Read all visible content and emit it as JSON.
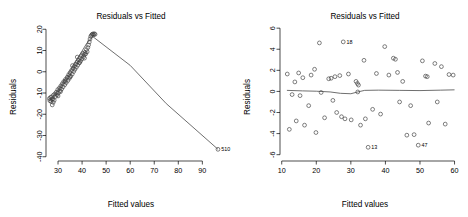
{
  "figure": {
    "panel_count": 2,
    "background_color": "#ffffff",
    "point_color": "#3a3a3a",
    "line_color": "#4a4a4a"
  },
  "chart_data": [
    {
      "type": "scatter",
      "panel": "left",
      "title": "Residuals vs Fitted",
      "xlabel": "Fitted values",
      "ylabel": "Residuals",
      "xlim": [
        25,
        99
      ],
      "ylim": [
        -42,
        22
      ],
      "xticks": [
        30,
        40,
        50,
        60,
        70,
        80,
        90
      ],
      "xtick_labels": [
        "30",
        "40",
        "50",
        "60",
        "70",
        "80",
        "90"
      ],
      "yticks": [
        20,
        10,
        0,
        -10,
        -20,
        -30,
        -40
      ],
      "ytick_labels": [
        "20",
        "10",
        "0",
        "-10",
        "-20",
        "-30",
        "-40"
      ],
      "grid": false,
      "legend": false,
      "annotations": [
        {
          "label": "510",
          "x": 96.5,
          "y": -36.5
        }
      ],
      "smooth_line": {
        "name": "loess-smoother",
        "x": [
          27.0,
          33.0,
          38.0,
          42.0,
          44.5,
          60.0,
          75.0,
          96.5
        ],
        "y": [
          -13.0,
          -3.5,
          6.0,
          13.5,
          16.5,
          3.0,
          -15.0,
          -36.5
        ]
      },
      "points": [
        {
          "x": 26.4,
          "y": -12.6
        },
        {
          "x": 26.6,
          "y": -13.6
        },
        {
          "x": 26.9,
          "y": -12.1
        },
        {
          "x": 27.1,
          "y": -14.0
        },
        {
          "x": 27.3,
          "y": -11.8
        },
        {
          "x": 27.4,
          "y": -13.0
        },
        {
          "x": 27.6,
          "y": -15.6
        },
        {
          "x": 27.8,
          "y": -12.8
        },
        {
          "x": 28.1,
          "y": -11.0
        },
        {
          "x": 28.4,
          "y": -13.4
        },
        {
          "x": 28.7,
          "y": -10.4
        },
        {
          "x": 29.0,
          "y": -11.6
        },
        {
          "x": 29.3,
          "y": -9.6
        },
        {
          "x": 29.6,
          "y": -10.8
        },
        {
          "x": 29.9,
          "y": -8.4
        },
        {
          "x": 30.2,
          "y": -9.9
        },
        {
          "x": 30.6,
          "y": -7.6
        },
        {
          "x": 30.9,
          "y": -8.9
        },
        {
          "x": 31.2,
          "y": -6.6
        },
        {
          "x": 31.5,
          "y": -8.1
        },
        {
          "x": 31.8,
          "y": -5.6
        },
        {
          "x": 32.1,
          "y": -7.1
        },
        {
          "x": 32.4,
          "y": -4.6
        },
        {
          "x": 32.8,
          "y": -6.1
        },
        {
          "x": 33.1,
          "y": -3.6
        },
        {
          "x": 33.4,
          "y": -5.1
        },
        {
          "x": 33.8,
          "y": -2.6
        },
        {
          "x": 34.1,
          "y": -4.1
        },
        {
          "x": 34.4,
          "y": -1.4
        },
        {
          "x": 34.7,
          "y": -3.1
        },
        {
          "x": 35.0,
          "y": -0.4
        },
        {
          "x": 35.3,
          "y": -2.1
        },
        {
          "x": 35.6,
          "y": 0.6
        },
        {
          "x": 35.9,
          "y": -1.1
        },
        {
          "x": 36.2,
          "y": 1.6
        },
        {
          "x": 36.5,
          "y": 0.1
        },
        {
          "x": 36.8,
          "y": 2.6
        },
        {
          "x": 37.0,
          "y": 1.1
        },
        {
          "x": 37.3,
          "y": 3.6
        },
        {
          "x": 37.6,
          "y": 2.1
        },
        {
          "x": 37.9,
          "y": 4.6
        },
        {
          "x": 38.2,
          "y": 3.1
        },
        {
          "x": 38.5,
          "y": 5.6
        },
        {
          "x": 38.8,
          "y": 4.1
        },
        {
          "x": 39.1,
          "y": 6.6
        },
        {
          "x": 39.4,
          "y": 5.1
        },
        {
          "x": 39.7,
          "y": 7.6
        },
        {
          "x": 40.0,
          "y": 6.1
        },
        {
          "x": 40.3,
          "y": 8.6
        },
        {
          "x": 40.6,
          "y": 7.1
        },
        {
          "x": 40.9,
          "y": 8.1
        },
        {
          "x": 41.2,
          "y": 9.1
        },
        {
          "x": 41.5,
          "y": 8.4
        },
        {
          "x": 41.8,
          "y": 10.4
        },
        {
          "x": 42.1,
          "y": 9.4
        },
        {
          "x": 42.4,
          "y": 11.4
        },
        {
          "x": 42.7,
          "y": 12.6
        },
        {
          "x": 43.0,
          "y": 14.0
        },
        {
          "x": 43.3,
          "y": 15.4
        },
        {
          "x": 43.6,
          "y": 16.6
        },
        {
          "x": 43.9,
          "y": 17.2
        },
        {
          "x": 44.2,
          "y": 17.6
        },
        {
          "x": 44.5,
          "y": 17.8
        },
        {
          "x": 44.8,
          "y": 17.4
        },
        {
          "x": 45.1,
          "y": 17.9
        },
        {
          "x": 45.4,
          "y": 17.6
        },
        {
          "x": 33.0,
          "y": -4.4
        },
        {
          "x": 34.9,
          "y": -2.4
        },
        {
          "x": 36.0,
          "y": 2.9
        },
        {
          "x": 38.0,
          "y": 6.9
        },
        {
          "x": 39.0,
          "y": 4.4
        },
        {
          "x": 41.0,
          "y": 6.4
        },
        {
          "x": 28.0,
          "y": -14.4
        },
        {
          "x": 30.0,
          "y": -11.4
        },
        {
          "x": 31.0,
          "y": -9.4
        },
        {
          "x": 96.5,
          "y": -36.5
        }
      ]
    },
    {
      "type": "scatter",
      "panel": "right",
      "title": "Residuals vs Fitted",
      "xlabel": "Fitted values",
      "ylabel": "Residuals",
      "xlim": [
        9.5,
        61
      ],
      "ylim": [
        -6.6,
        6.3
      ],
      "xticks": [
        10,
        20,
        30,
        40,
        50,
        60
      ],
      "xtick_labels": [
        "10",
        "20",
        "30",
        "40",
        "50",
        "60"
      ],
      "yticks": [
        6,
        4,
        2,
        0,
        -2,
        -4,
        -6
      ],
      "ytick_labels": [
        "6",
        "4",
        "2",
        "0",
        "-2",
        "-4",
        "-6"
      ],
      "grid": false,
      "legend": false,
      "annotations": [
        {
          "label": "18",
          "x": 27.8,
          "y": 4.7
        },
        {
          "label": "13",
          "x": 35.0,
          "y": -5.3
        },
        {
          "label": "47",
          "x": 49.5,
          "y": -5.1
        }
      ],
      "smooth_line": {
        "name": "loess-smoother",
        "x": [
          11.5,
          16.0,
          20.0,
          24.0,
          27.0,
          30.0,
          32.0,
          34.0,
          38.0,
          44.0,
          50.0,
          56.0,
          60.0
        ],
        "y": [
          0.1,
          0.05,
          0.02,
          -0.05,
          -0.18,
          -0.22,
          -0.05,
          0.1,
          0.12,
          0.1,
          0.08,
          0.12,
          0.15
        ]
      },
      "points": [
        {
          "x": 11.6,
          "y": 1.65
        },
        {
          "x": 12.2,
          "y": -3.6
        },
        {
          "x": 13.0,
          "y": -0.3
        },
        {
          "x": 13.8,
          "y": 0.9
        },
        {
          "x": 14.2,
          "y": -2.8
        },
        {
          "x": 14.9,
          "y": 1.75
        },
        {
          "x": 15.3,
          "y": -0.4
        },
        {
          "x": 16.1,
          "y": 1.3
        },
        {
          "x": 16.6,
          "y": -3.2
        },
        {
          "x": 17.8,
          "y": -1.35
        },
        {
          "x": 18.5,
          "y": 1.55
        },
        {
          "x": 19.5,
          "y": 2.1
        },
        {
          "x": 19.9,
          "y": -3.9
        },
        {
          "x": 20.9,
          "y": 4.6
        },
        {
          "x": 21.4,
          "y": -0.1
        },
        {
          "x": 22.4,
          "y": -2.5
        },
        {
          "x": 23.6,
          "y": 1.2
        },
        {
          "x": 24.3,
          "y": 1.25
        },
        {
          "x": 24.8,
          "y": -0.85
        },
        {
          "x": 25.4,
          "y": 1.4
        },
        {
          "x": 25.9,
          "y": -2.0
        },
        {
          "x": 26.8,
          "y": 1.5
        },
        {
          "x": 27.3,
          "y": -2.4
        },
        {
          "x": 27.8,
          "y": 4.7
        },
        {
          "x": 28.3,
          "y": -2.6
        },
        {
          "x": 29.3,
          "y": 1.65
        },
        {
          "x": 30.1,
          "y": -2.7
        },
        {
          "x": 31.5,
          "y": 0.95
        },
        {
          "x": 31.9,
          "y": 0.75
        },
        {
          "x": 32.2,
          "y": 0.6
        },
        {
          "x": 32.0,
          "y": -0.05
        },
        {
          "x": 32.8,
          "y": -3.2
        },
        {
          "x": 33.8,
          "y": 2.95
        },
        {
          "x": 35.0,
          "y": -5.3
        },
        {
          "x": 36.3,
          "y": -1.7
        },
        {
          "x": 37.4,
          "y": 1.7
        },
        {
          "x": 38.6,
          "y": -2.15
        },
        {
          "x": 39.8,
          "y": 4.25
        },
        {
          "x": 41.0,
          "y": 1.55
        },
        {
          "x": 42.3,
          "y": 3.15
        },
        {
          "x": 42.9,
          "y": 3.05
        },
        {
          "x": 43.5,
          "y": 1.8
        },
        {
          "x": 44.1,
          "y": -1.0
        },
        {
          "x": 45.0,
          "y": 0.95
        },
        {
          "x": 46.2,
          "y": -4.15
        },
        {
          "x": 47.3,
          "y": -1.35
        },
        {
          "x": 48.3,
          "y": -4.1
        },
        {
          "x": 49.5,
          "y": -5.1
        },
        {
          "x": 50.7,
          "y": 2.9
        },
        {
          "x": 51.6,
          "y": 1.45
        },
        {
          "x": 52.1,
          "y": 1.4
        },
        {
          "x": 52.5,
          "y": -3.0
        },
        {
          "x": 54.3,
          "y": 2.65
        },
        {
          "x": 55.0,
          "y": -1.0
        },
        {
          "x": 56.2,
          "y": 2.35
        },
        {
          "x": 57.3,
          "y": -3.1
        },
        {
          "x": 58.4,
          "y": 1.6
        },
        {
          "x": 59.6,
          "y": 1.55
        },
        {
          "x": 34.2,
          "y": -2.6
        }
      ]
    }
  ]
}
